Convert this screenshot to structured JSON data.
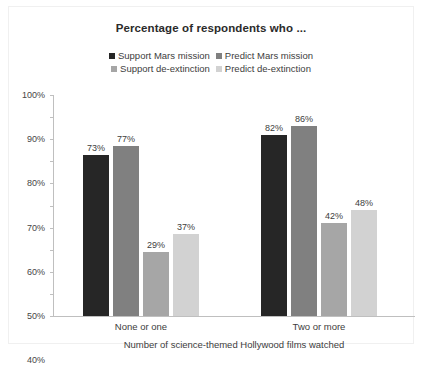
{
  "chart_data": {
    "type": "bar",
    "title": "Percentage of respondents who ...",
    "xlabel": "Number of science-themed Hollywood films watched",
    "ylabel": "",
    "categories": [
      "None or one",
      "Two or more"
    ],
    "ylim": [
      0,
      100
    ],
    "yticks": [
      "0%",
      "10%",
      "20%",
      "30%",
      "40%",
      "50%",
      "60%",
      "70%",
      "80%",
      "90%",
      "100%"
    ],
    "ytick_values": [
      0,
      10,
      20,
      30,
      40,
      50,
      60,
      70,
      80,
      90,
      100
    ],
    "grid": false,
    "legend_position": "top-center",
    "series": [
      {
        "name": "Support Mars mission",
        "color": "#262626",
        "values": [
          73,
          82
        ],
        "labels": [
          "73%",
          "82%"
        ]
      },
      {
        "name": "Predict Mars mission",
        "color": "#808080",
        "values": [
          77,
          86
        ],
        "labels": [
          "77%",
          "86%"
        ]
      },
      {
        "name": "Support de-extinction",
        "color": "#a6a6a6",
        "values": [
          29,
          42
        ],
        "labels": [
          "29%",
          "42%"
        ]
      },
      {
        "name": "Predict de-extinction",
        "color": "#d2d2d2",
        "values": [
          37,
          48
        ],
        "labels": [
          "37%",
          "48%"
        ]
      }
    ]
  }
}
